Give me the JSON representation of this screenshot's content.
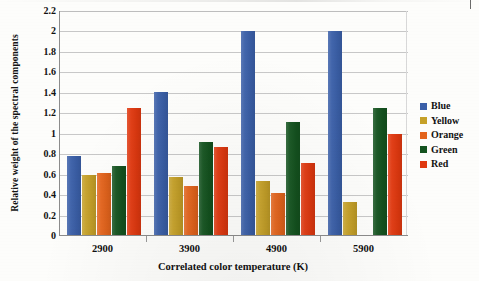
{
  "chart_data": {
    "type": "bar",
    "title": "",
    "xlabel": "Correlated color temperature (K)",
    "ylabel": "Relative weight of the spectral components",
    "categories": [
      "2900",
      "3900",
      "4900",
      "5900"
    ],
    "ylim": [
      0,
      2.2
    ],
    "ytick_step": 0.2,
    "yticks": [
      "2.2",
      "2",
      "1.8",
      "1.6",
      "1.4",
      "1.2",
      "1",
      "0.8",
      "0.6",
      "0.4",
      "0.2",
      "0"
    ],
    "ytick_values": [
      2.2,
      2,
      1.8,
      1.6,
      1.4,
      1.2,
      1,
      0.8,
      0.6,
      0.4,
      0.2,
      0
    ],
    "grid": true,
    "grid_axis": "y",
    "legend_position": "right",
    "series": [
      {
        "name": "Blue",
        "color": "#3a5fa8",
        "values": [
          0.78,
          1.41,
          2.0,
          2.0
        ]
      },
      {
        "name": "Yellow",
        "color": "#c6a128",
        "values": [
          0.6,
          0.58,
          0.54,
          0.33
        ]
      },
      {
        "name": "Orange",
        "color": "#e4641c",
        "values": [
          0.62,
          0.49,
          0.42,
          null
        ]
      },
      {
        "name": "Green",
        "color": "#14531f",
        "values": [
          0.68,
          0.92,
          1.11,
          1.25
        ]
      },
      {
        "name": "Red",
        "color": "#e0380f",
        "values": [
          1.25,
          0.87,
          0.71,
          1.0
        ]
      }
    ]
  },
  "legend": {
    "items": [
      {
        "label": "Blue",
        "color": "#3a5fa8"
      },
      {
        "label": "Yellow",
        "color": "#c6a128"
      },
      {
        "label": "Orange",
        "color": "#e4641c"
      },
      {
        "label": "Green",
        "color": "#14531f"
      },
      {
        "label": "Red",
        "color": "#e0380f"
      }
    ]
  }
}
